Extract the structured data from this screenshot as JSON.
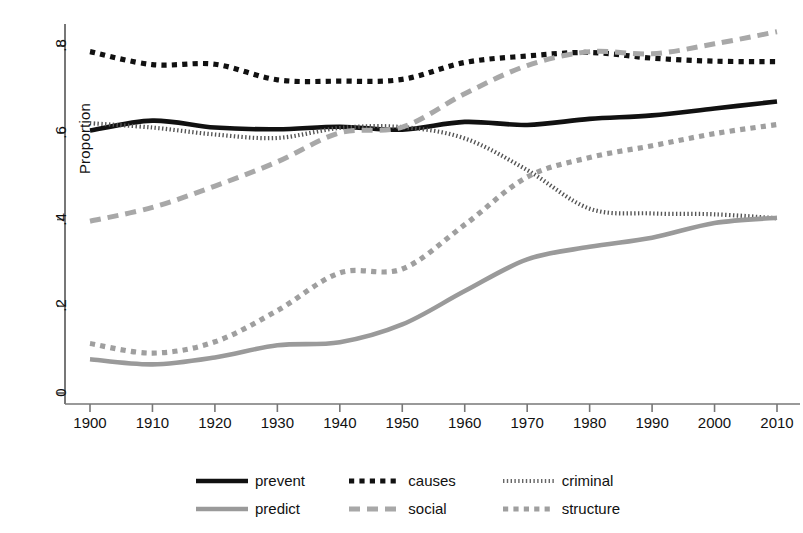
{
  "chart_data": {
    "type": "line",
    "title": "",
    "subtitle": "",
    "xlabel": "",
    "ylabel": "Proportion",
    "xlim": [
      1900,
      2010
    ],
    "ylim": [
      0,
      0.88
    ],
    "grid": false,
    "legend_position": "bottom",
    "x_tick_labels": [
      "1900",
      "1910",
      "1920",
      "1930",
      "1940",
      "1950",
      "1960",
      "1970",
      "1980",
      "1990",
      "2000",
      "2010"
    ],
    "y_tick_labels": [
      "0",
      ".2",
      ".4",
      ".6",
      ".8"
    ],
    "y_tick_values": [
      0,
      0.2,
      0.4,
      0.6,
      0.8
    ],
    "x": [
      1900,
      1910,
      1920,
      1930,
      1940,
      1950,
      1960,
      1970,
      1980,
      1990,
      2000,
      2010
    ],
    "series": [
      {
        "name": "prevent",
        "color": "#111111",
        "style": "solid",
        "values": [
          0.605,
          0.628,
          0.612,
          0.608,
          0.614,
          0.607,
          0.625,
          0.618,
          0.632,
          0.64,
          0.656,
          0.672
        ]
      },
      {
        "name": "causes",
        "color": "#111111",
        "style": "dotted-square",
        "values": [
          0.787,
          0.757,
          0.758,
          0.722,
          0.719,
          0.723,
          0.762,
          0.777,
          0.785,
          0.772,
          0.765,
          0.764
        ]
      },
      {
        "name": "criminal",
        "color": "#555555",
        "style": "fine-dotted",
        "values": [
          0.622,
          0.612,
          0.596,
          0.588,
          0.611,
          0.613,
          0.587,
          0.514,
          0.425,
          0.414,
          0.412,
          0.403
        ]
      },
      {
        "name": "predict",
        "color": "#9a9a9a",
        "style": "solid",
        "values": [
          0.078,
          0.066,
          0.082,
          0.11,
          0.117,
          0.158,
          0.235,
          0.308,
          0.337,
          0.358,
          0.392,
          0.404
        ]
      },
      {
        "name": "social",
        "color": "#a8a8a8",
        "style": "dashed",
        "values": [
          0.396,
          0.428,
          0.477,
          0.533,
          0.6,
          0.613,
          0.69,
          0.755,
          0.787,
          0.782,
          0.805,
          0.833
        ]
      },
      {
        "name": "structure",
        "color": "#9f9f9f",
        "style": "dotted-square",
        "values": [
          0.114,
          0.092,
          0.118,
          0.19,
          0.277,
          0.286,
          0.388,
          0.498,
          0.543,
          0.57,
          0.598,
          0.619
        ]
      }
    ],
    "legend": [
      {
        "label": "prevent",
        "color": "#111111",
        "style": "solid"
      },
      {
        "label": "causes",
        "color": "#111111",
        "style": "dotted-square"
      },
      {
        "label": "criminal",
        "color": "#666666",
        "style": "fine-dotted"
      },
      {
        "label": "predict",
        "color": "#9a9a9a",
        "style": "solid"
      },
      {
        "label": "social",
        "color": "#a8a8a8",
        "style": "dashed"
      },
      {
        "label": "structure",
        "color": "#9f9f9f",
        "style": "dotted-square"
      }
    ]
  },
  "axis": {
    "y_title": "Proportion"
  }
}
